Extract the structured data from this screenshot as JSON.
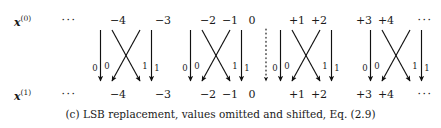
{
  "figure": {
    "caption": "(c) LSB replacement, values omitted and shifted, Eq. (2.9)",
    "ellipsis": "···",
    "rows": [
      {
        "id": "input-row",
        "symbol": "x",
        "superscript": "(0)",
        "label_full": "x(0)",
        "y": 21,
        "values": [
          "−4",
          "−3",
          "−2",
          "−1",
          "0",
          "+1",
          "+2",
          "+3",
          "+4"
        ]
      },
      {
        "id": "output-row",
        "symbol": "x",
        "superscript": "(1)",
        "label_full": "x(1)",
        "y": 95,
        "values": [
          "−4",
          "−3",
          "−2",
          "−1",
          "0",
          "+1",
          "+2",
          "+3",
          "+4"
        ]
      }
    ],
    "column_positions": [
      118,
      163,
      208,
      230,
      252,
      297,
      319,
      364,
      386
    ],
    "label_x": 31,
    "left_ellipsis_x": 69,
    "right_ellipsis_x": 425,
    "mapping_groups": [
      {
        "name": "group-minus-4-minus-3",
        "source_left": "−4",
        "source_right": "−3",
        "target_left": "−4",
        "target_right": "−3",
        "bits": [
          "0",
          "0",
          "1",
          "1"
        ]
      },
      {
        "name": "group-minus-2-minus-1",
        "source_left": "−2",
        "source_right": "−1",
        "target_left": "−2",
        "target_right": "−1",
        "bits": [
          "0",
          "0",
          "1",
          "1"
        ]
      },
      {
        "name": "group-plus-1-plus-2",
        "source_left": "+1",
        "source_right": "+2",
        "target_left": "+1",
        "target_right": "+2",
        "bits": [
          "0",
          "0",
          "1",
          "1"
        ]
      },
      {
        "name": "group-plus-3-plus-4",
        "source_left": "+3",
        "source_right": "+4",
        "target_left": "+3",
        "target_right": "+4",
        "bits": [
          "0",
          "0",
          "1",
          "1"
        ]
      }
    ],
    "center_column": {
      "name": "zero-passthrough",
      "value": "0",
      "style": "dotted"
    },
    "colors": {
      "ink": "#1a1a1a",
      "arrow": "#111111",
      "background": "#ffffff"
    }
  }
}
